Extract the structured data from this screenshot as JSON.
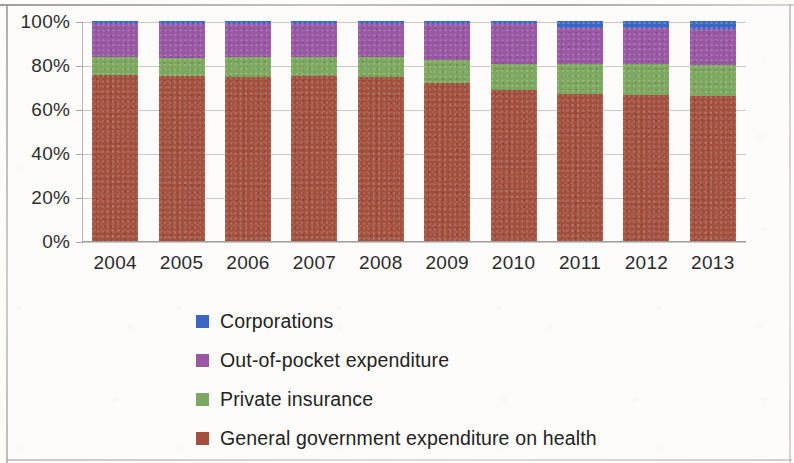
{
  "chart_data": {
    "type": "bar",
    "subtype": "stacked-100-percent",
    "title": "",
    "subtitle": "",
    "xlabel": "",
    "ylabel": "",
    "categories": [
      "2004",
      "2005",
      "2006",
      "2007",
      "2008",
      "2009",
      "2010",
      "2011",
      "2012",
      "2013"
    ],
    "ylim": [
      0,
      100
    ],
    "ytick_labels": [
      "0%",
      "20%",
      "40%",
      "60%",
      "80%",
      "100%"
    ],
    "ytick_values": [
      0,
      20,
      40,
      60,
      80,
      100
    ],
    "grid": true,
    "legend_position": "bottom",
    "stack_order_bottom_to_top": [
      "General government expenditure on health",
      "Private insurance",
      "Out-of-pocket expenditure",
      "Corporations"
    ],
    "series": [
      {
        "name": "General government expenditure on health",
        "color": "#a4503f",
        "values": [
          75.5,
          75.0,
          74.5,
          75.0,
          74.5,
          72.0,
          68.5,
          67.0,
          66.5,
          66.0
        ]
      },
      {
        "name": "Private insurance",
        "color": "#7ea85f",
        "values": [
          8.0,
          8.0,
          9.0,
          8.5,
          9.0,
          10.5,
          12.0,
          13.5,
          14.0,
          14.0
        ]
      },
      {
        "name": "Out-of-pocket expenditure",
        "color": "#9a58a4",
        "values": [
          15.0,
          15.5,
          15.0,
          15.0,
          15.0,
          16.0,
          18.0,
          16.5,
          16.5,
          16.5
        ]
      },
      {
        "name": "Corporations",
        "color": "#3b66c4",
        "values": [
          1.5,
          1.5,
          1.5,
          1.5,
          1.5,
          1.5,
          1.5,
          3.0,
          3.0,
          3.5
        ]
      }
    ]
  },
  "legend": {
    "items": [
      {
        "label": "Corporations",
        "color": "#3b66c4"
      },
      {
        "label": "Out-of-pocket expenditure",
        "color": "#9a58a4"
      },
      {
        "label": "Private insurance",
        "color": "#7ea85f"
      },
      {
        "label": "General government expenditure on health",
        "color": "#a4503f"
      }
    ]
  }
}
